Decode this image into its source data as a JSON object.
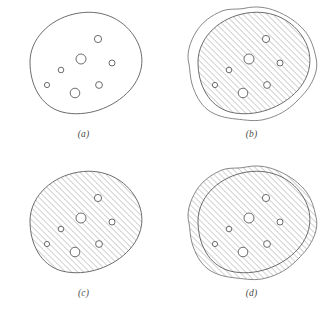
{
  "figure": {
    "background_color": "#ffffff",
    "outline_color": "#5b5b5b",
    "hatch_color": "#9a9a9a",
    "hole_color": "#5b5b5b",
    "layout": "2x2-grid",
    "panel_count": 4
  },
  "panels": [
    {
      "id": "a",
      "label": "(a)",
      "caption_style": "italic-serif",
      "description": "Original set A: outlined blob containing seven unfilled holes",
      "filled": false,
      "hatched": false,
      "show_inner_outline": true,
      "show_dilated_outline": false,
      "hatch_region": "none"
    },
    {
      "id": "b",
      "label": "(b)",
      "caption_style": "italic-serif",
      "description": "Set A hatched, with dilated wavy boundary drawn outside it",
      "filled": true,
      "hatched": true,
      "show_inner_outline": true,
      "show_dilated_outline": true,
      "hatch_region": "inner"
    },
    {
      "id": "c",
      "label": "(c)",
      "caption_style": "italic-serif",
      "description": "Set A fully hatched showing holes as unfilled circles",
      "filled": true,
      "hatched": true,
      "show_inner_outline": true,
      "show_dilated_outline": false,
      "hatch_region": "inner"
    },
    {
      "id": "d",
      "label": "(d)",
      "caption_style": "italic-serif",
      "description": "Dilated set hatched, original boundary still visible inside",
      "filled": true,
      "hatched": true,
      "show_inner_outline": true,
      "show_dilated_outline": true,
      "hatch_region": "dilated"
    }
  ],
  "geometry": {
    "blob_path": "M 30 62 C 30 40 48 20 74 14 C 100 8 122 18 134 36 C 146 54 144 74 130 90 C 114 108 86 118 62 112 C 40 106 30 84 30 62 Z",
    "dilated_path": "M 21 64 C 18 54 22 42 28 32 C 34 22 44 15 54 11 C 62 8 70 10 78 8 C 88 6 98 7 108 11 C 118 15 128 21 136 30 C 143 38 146 48 148 58 C 150 66 148 74 144 82 C 140 90 134 96 128 102 C 120 110 110 116 98 119 C 88 122 78 120 68 119 C 58 118 48 116 40 110 C 32 104 27 94 24 84 C 22 77 22 70 21 64 Z",
    "holes": [
      {
        "cx": 98,
        "cy": 39,
        "r": 3.6
      },
      {
        "cx": 81,
        "cy": 59,
        "r": 5.0
      },
      {
        "cx": 112,
        "cy": 63,
        "r": 3.0
      },
      {
        "cx": 61,
        "cy": 70,
        "r": 2.8
      },
      {
        "cx": 47,
        "cy": 85,
        "r": 2.6
      },
      {
        "cx": 99,
        "cy": 85,
        "r": 3.4
      },
      {
        "cx": 75,
        "cy": 93,
        "r": 4.8
      }
    ],
    "hatch_angle_deg": 45,
    "hatch_spacing_px": 3
  }
}
